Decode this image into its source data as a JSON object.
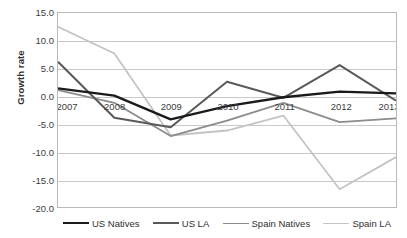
{
  "chart_data": {
    "type": "line",
    "title": "",
    "xlabel": "",
    "ylabel": "Growth rate",
    "categories": [
      "2007",
      "2008",
      "2009",
      "2010",
      "2011",
      "2012",
      "2013"
    ],
    "x": [
      2007,
      2008,
      2009,
      2010,
      2011,
      2012,
      2013
    ],
    "ylim": [
      -20.0,
      15.0
    ],
    "yticks": [
      15.0,
      10.0,
      5.0,
      0.0,
      -5.0,
      -10.0,
      -15.0,
      -20.0
    ],
    "ytick_labels": [
      "15.0",
      "10.0",
      "5.0",
      "0.0",
      "-5.0",
      "-10.0",
      "-15.0",
      "-20.0"
    ],
    "grid": true,
    "legend_position": "bottom",
    "series": [
      {
        "name": "US Natives",
        "color": "#1a1a1a",
        "width": 2.3,
        "values": [
          1.4,
          0.1,
          -4.2,
          -1.8,
          -0.2,
          0.8,
          0.5
        ]
      },
      {
        "name": "US LA",
        "color": "#595959",
        "width": 2.0,
        "values": [
          6.2,
          -3.9,
          -5.6,
          2.6,
          -0.3,
          5.6,
          -0.8
        ]
      },
      {
        "name": "Spain Natives",
        "color": "#8c8c8c",
        "width": 1.8,
        "values": [
          1.1,
          -1.2,
          -7.2,
          -4.4,
          -1.2,
          -4.7,
          -4.0
        ]
      },
      {
        "name": "Spain LA",
        "color": "#c4c4c4",
        "width": 1.8,
        "values": [
          12.5,
          7.7,
          -7.1,
          -6.2,
          -3.5,
          -16.8,
          -11.0
        ]
      }
    ]
  },
  "axis": {
    "y_title": "Growth rate"
  },
  "legend": {
    "items": [
      {
        "label": "US Natives",
        "color": "#1a1a1a",
        "width": 2.6
      },
      {
        "label": "US LA",
        "color": "#595959",
        "width": 2.3
      },
      {
        "label": "Spain Natives",
        "color": "#8c8c8c",
        "width": 1.8
      },
      {
        "label": "Spain LA",
        "color": "#c4c4c4",
        "width": 1.8
      }
    ]
  }
}
